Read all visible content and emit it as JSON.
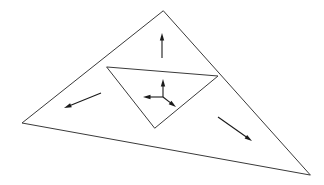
{
  "figure": {
    "type": "line-diagram",
    "canvas": {
      "width": 324,
      "height": 185,
      "background": "#ffffff"
    },
    "stroke_color": "#3a3a3a",
    "arrow_color": "#1a1a1a",
    "stroke_width": 1
  },
  "geometry": {
    "vertices": {
      "apex": {
        "name": "top-vertex",
        "x": 163,
        "y": 11
      },
      "left": {
        "name": "left-vertex",
        "x": 22,
        "y": 123
      },
      "right": {
        "name": "right-vertex",
        "x": 310,
        "y": 175
      },
      "mid_left": {
        "name": "midpoint-left-edge",
        "x": 107,
        "y": 67
      },
      "mid_right": {
        "name": "midpoint-right-edge",
        "x": 218,
        "y": 76
      },
      "mid_bottom": {
        "name": "midpoint-bottom-edge",
        "x": 155,
        "y": 128
      }
    },
    "outer_triangle": {
      "name": "outer-triangle",
      "path": "M 163 11 L 22 123 L 310 175 Z"
    },
    "inner_triangle": {
      "name": "inner-medial-triangle",
      "path": "M 107 67 L 218 76 L 155 128 Z"
    },
    "regions": [
      {
        "name": "top-subtriangle",
        "path": "M 163 11 L 107 67 L 218 76 Z"
      },
      {
        "name": "left-subtriangle",
        "path": "M 22 123 L 107 67 L 155 128 Z"
      },
      {
        "name": "right-subtriangle",
        "path": "M 310 175 L 218 76 L 155 128 Z"
      },
      {
        "name": "center-subtriangle",
        "path": "M 107 67 L 218 76 L 155 128 Z"
      }
    ]
  },
  "arrows": [
    {
      "id": "top-arrow",
      "name": "top-region-arrow",
      "region": "top-subtriangle",
      "direction": "up",
      "tail": {
        "x": 162,
        "y": 58
      },
      "tip": {
        "x": 162,
        "y": 33
      },
      "angle_deg": 270,
      "length": 25
    },
    {
      "id": "center-up-arrow",
      "name": "center-up-arrow",
      "region": "center-subtriangle",
      "direction": "up",
      "tail": {
        "x": 163,
        "y": 97
      },
      "tip": {
        "x": 163,
        "y": 79
      },
      "angle_deg": 270,
      "length": 18
    },
    {
      "id": "center-left-arrow",
      "name": "center-left-arrow",
      "region": "center-subtriangle",
      "direction": "left",
      "tail": {
        "x": 163,
        "y": 97
      },
      "tip": {
        "x": 143,
        "y": 97
      },
      "angle_deg": 180,
      "length": 20
    },
    {
      "id": "center-down-right-arrow",
      "name": "center-down-right-arrow",
      "region": "center-subtriangle",
      "direction": "down-right",
      "tail": {
        "x": 163,
        "y": 97
      },
      "tip": {
        "x": 176,
        "y": 107
      },
      "angle_deg": 38,
      "length": 16
    },
    {
      "id": "left-arrow",
      "name": "left-region-arrow",
      "region": "left-subtriangle",
      "direction": "down-left",
      "tail": {
        "x": 101,
        "y": 93
      },
      "tip": {
        "x": 64,
        "y": 108
      },
      "angle_deg": 202,
      "length": 40
    },
    {
      "id": "right-arrow",
      "name": "right-region-arrow",
      "region": "right-subtriangle",
      "direction": "down-right",
      "tail": {
        "x": 218,
        "y": 117
      },
      "tip": {
        "x": 252,
        "y": 141
      },
      "angle_deg": 35,
      "length": 42
    }
  ]
}
